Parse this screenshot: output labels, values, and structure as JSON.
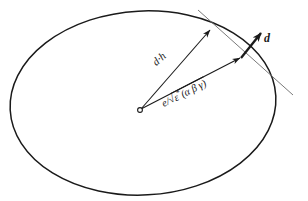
{
  "figure": {
    "background_color": "#ffffff",
    "stroke_color": "#1a1a1a",
    "width": 308,
    "height": 201
  },
  "labels": {
    "dot_product": "d·h",
    "epsilon_expression_prefix": "e/",
    "epsilon_radical_body": "ε",
    "epsilon_star": "*",
    "epsilon_args": "(α β γ)",
    "normal_vector": "d"
  },
  "geometry": {
    "ellipse": {
      "cx": 143,
      "cy": 103,
      "rx": 133,
      "ry": 92,
      "rotation_deg": -3
    },
    "origin_marker": {
      "cx": 140,
      "cy": 110,
      "r": 2.4
    },
    "arrow_dot_h": {
      "x1": 141,
      "y1": 109,
      "x2": 212,
      "y2": 28
    },
    "arrow_epsilon": {
      "x1": 141,
      "y1": 109,
      "x2": 242,
      "y2": 57
    },
    "tangent_line": {
      "x1": 198,
      "y1": 10,
      "x2": 293,
      "y2": 95
    },
    "normal_arrow": {
      "x1": 241,
      "y1": 58,
      "x2": 263,
      "y2": 31
    }
  },
  "colors": {
    "ink": "#1a1a1a",
    "thin_line": "#555555",
    "paper": "#ffffff"
  }
}
